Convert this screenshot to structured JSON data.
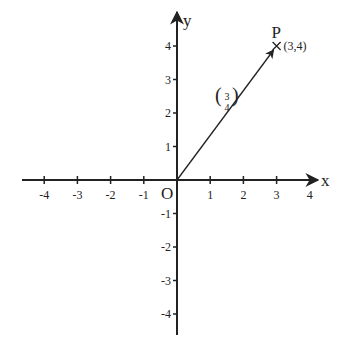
{
  "chart_data": {
    "type": "scatter",
    "title": "",
    "xlabel": "x",
    "ylabel": "y",
    "origin_label": "O",
    "xlim": [
      -4.5,
      4.5
    ],
    "ylim": [
      -4.5,
      4.5
    ],
    "x_ticks": [
      -4,
      -3,
      -2,
      -1,
      1,
      2,
      3,
      4
    ],
    "y_ticks": [
      4,
      3,
      2,
      1,
      -1,
      -2,
      -3,
      -4
    ],
    "x_tick_labels": [
      "-4",
      "-3",
      "-2",
      "-1",
      "1",
      "2",
      "3",
      "4"
    ],
    "y_tick_labels": [
      "4",
      "3",
      "2",
      "1",
      "-1",
      "-2",
      "-3",
      "-4"
    ],
    "grid": false,
    "points": [
      {
        "name": "P",
        "x": 3,
        "y": 4,
        "label": "(3,4)",
        "marker": "x"
      }
    ],
    "vectors": [
      {
        "from": [
          0,
          0
        ],
        "to": [
          3,
          4
        ],
        "label_top": "3",
        "label_bottom": "4"
      }
    ]
  }
}
